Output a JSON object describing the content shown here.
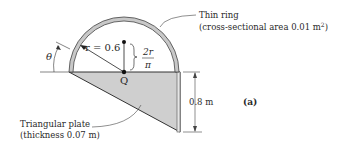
{
  "figure": {
    "panel_label": "(a)",
    "ring_label_line1": "Thin ring",
    "ring_label_line2": "(cross-sectional area 0.01 m",
    "ring_label_sup": "2",
    "ring_label_close": ")",
    "plate_label_line1": "Triangular plate",
    "plate_label_line2": "(thickness 0.07 m)",
    "radius_label": "r = 0.6",
    "offset_num": "2r",
    "offset_den": "π",
    "point_label": "Q",
    "angle_label": "θ",
    "height_label": "0.8 m"
  },
  "colors": {
    "ring_fill": "#c8c8c8",
    "plate_fill": "#cfcfcf",
    "line": "#333333"
  }
}
